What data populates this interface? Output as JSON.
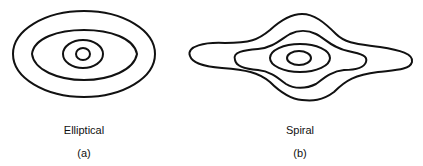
{
  "figure": {
    "panels": [
      {
        "id": "a",
        "name": "Elliptical",
        "sublabel": "(a)",
        "contours": 4
      },
      {
        "id": "b",
        "name": "Spiral",
        "sublabel": "(b)",
        "contours": 4
      }
    ],
    "colors": {
      "stroke": "#111111",
      "background": "#ffffff"
    }
  }
}
